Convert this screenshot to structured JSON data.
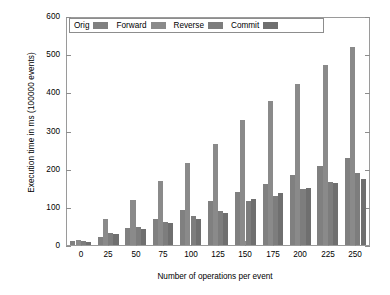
{
  "chart_data": {
    "type": "bar",
    "title": "",
    "xlabel": "Number of operations per event",
    "ylabel": "Execution time in ms (100000 events)",
    "categories": [
      "0",
      "25",
      "50",
      "75",
      "100",
      "125",
      "150",
      "175",
      "200",
      "225",
      "250"
    ],
    "ytick_labels": [
      "0",
      "100",
      "200",
      "300",
      "400",
      "500",
      "600"
    ],
    "ytick_values": [
      0,
      100,
      200,
      300,
      400,
      500,
      600
    ],
    "ylim": [
      0,
      600
    ],
    "grid": false,
    "legend_position": "top-inside",
    "series": [
      {
        "name": "Orig",
        "color": "#808080",
        "values": [
          12,
          21,
          45,
          69,
          93,
          116,
          139,
          162,
          185,
          208,
          231
        ]
      },
      {
        "name": "Forward",
        "color": "#8a8a8a",
        "values": [
          13,
          68,
          119,
          168,
          217,
          266,
          330,
          380,
          427,
          477,
          524
        ]
      },
      {
        "name": "Reverse",
        "color": "#7d7d7d",
        "values": [
          10,
          33,
          49,
          62,
          76,
          89,
          117,
          130,
          149,
          167,
          190
        ]
      },
      {
        "name": "Commit",
        "color": "#6f6f6f",
        "values": [
          9,
          28,
          42,
          57,
          70,
          84,
          123,
          137,
          150,
          164,
          174
        ]
      }
    ]
  },
  "legend": {
    "items": [
      {
        "label": "Orig"
      },
      {
        "label": "Forward"
      },
      {
        "label": "Reverse"
      },
      {
        "label": "Commit"
      }
    ]
  }
}
